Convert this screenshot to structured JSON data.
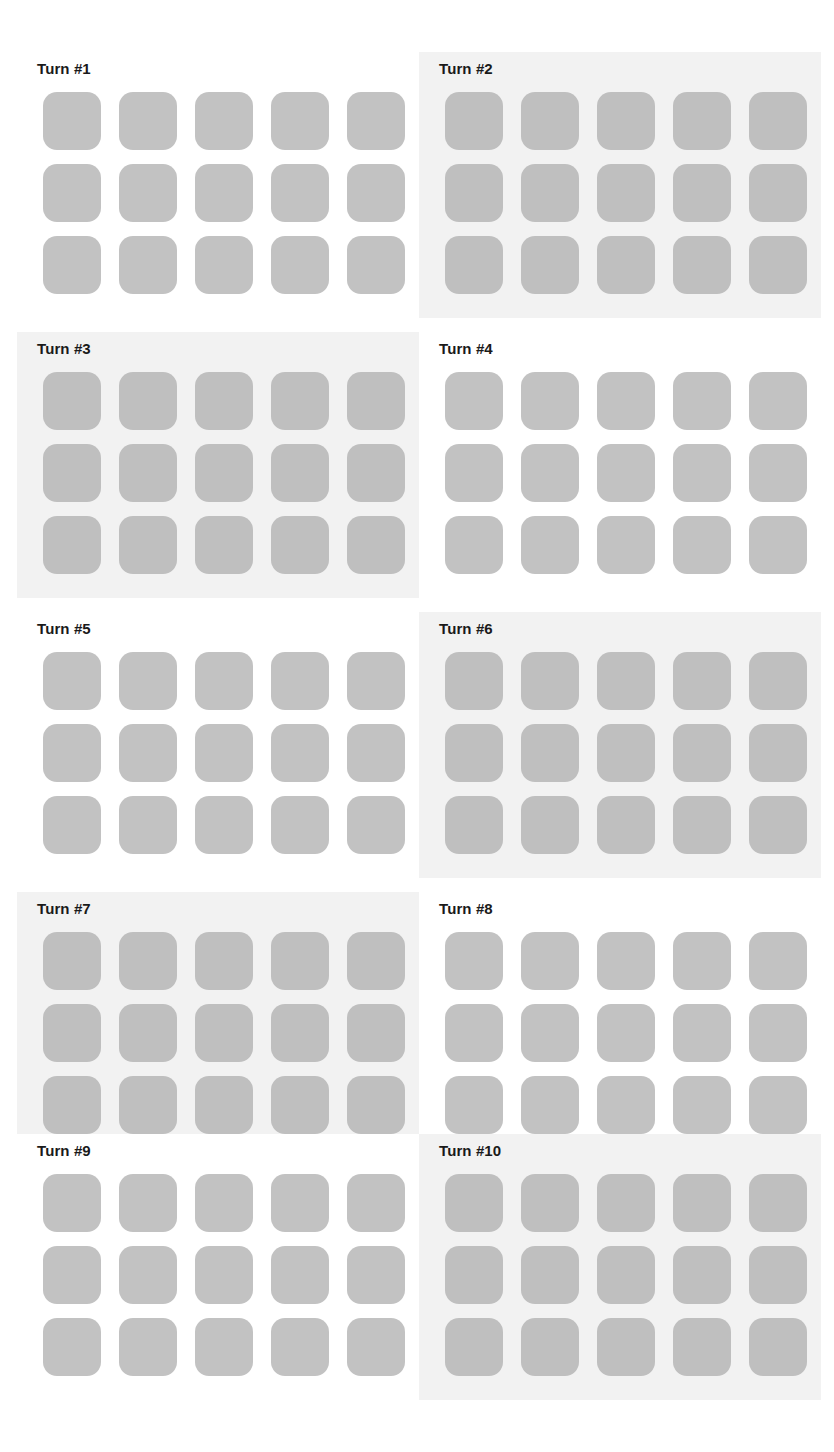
{
  "page": {
    "background_color": "#ffffff",
    "width": 834,
    "height": 1452,
    "columns": 2,
    "rows": 5
  },
  "style": {
    "tile_color": "#c2c2c2",
    "shaded_panel_color": "#f2f2f2",
    "plain_panel_color": "#ffffff",
    "title_color": "#1a1a1a"
  },
  "grid_spec": {
    "tile_columns": 5,
    "tile_rows": 3,
    "tiles_per_turn": 15
  },
  "turns": [
    {
      "id": 1,
      "label": "Turn #1",
      "shaded": false,
      "tiles": [
        [
          "#c2c2c2",
          "#c2c2c2",
          "#c2c2c2",
          "#c2c2c2",
          "#c2c2c2"
        ],
        [
          "#c2c2c2",
          "#c2c2c2",
          "#c2c2c2",
          "#c2c2c2",
          "#c2c2c2"
        ],
        [
          "#c2c2c2",
          "#c2c2c2",
          "#c2c2c2",
          "#c2c2c2",
          "#c2c2c2"
        ]
      ]
    },
    {
      "id": 2,
      "label": "Turn #2",
      "shaded": true,
      "tiles": [
        [
          "#bfbfbf",
          "#bfbfbf",
          "#bfbfbf",
          "#bfbfbf",
          "#bfbfbf"
        ],
        [
          "#bfbfbf",
          "#bfbfbf",
          "#bfbfbf",
          "#bfbfbf",
          "#bfbfbf"
        ],
        [
          "#bfbfbf",
          "#bfbfbf",
          "#bfbfbf",
          "#bfbfbf",
          "#bfbfbf"
        ]
      ]
    },
    {
      "id": 3,
      "label": "Turn #3",
      "shaded": true,
      "tiles": [
        [
          "#bfbfbf",
          "#bfbfbf",
          "#bfbfbf",
          "#bfbfbf",
          "#bfbfbf"
        ],
        [
          "#bfbfbf",
          "#bfbfbf",
          "#bfbfbf",
          "#bfbfbf",
          "#bfbfbf"
        ],
        [
          "#bfbfbf",
          "#bfbfbf",
          "#bfbfbf",
          "#bfbfbf",
          "#bfbfbf"
        ]
      ]
    },
    {
      "id": 4,
      "label": "Turn #4",
      "shaded": false,
      "tiles": [
        [
          "#c2c2c2",
          "#c2c2c2",
          "#c2c2c2",
          "#c2c2c2",
          "#c2c2c2"
        ],
        [
          "#c2c2c2",
          "#c2c2c2",
          "#c2c2c2",
          "#c2c2c2",
          "#c2c2c2"
        ],
        [
          "#c2c2c2",
          "#c2c2c2",
          "#c2c2c2",
          "#c2c2c2",
          "#c2c2c2"
        ]
      ]
    },
    {
      "id": 5,
      "label": "Turn #5",
      "shaded": false,
      "tiles": [
        [
          "#c2c2c2",
          "#c2c2c2",
          "#c2c2c2",
          "#c2c2c2",
          "#c2c2c2"
        ],
        [
          "#c2c2c2",
          "#c2c2c2",
          "#c2c2c2",
          "#c2c2c2",
          "#c2c2c2"
        ],
        [
          "#c2c2c2",
          "#c2c2c2",
          "#c2c2c2",
          "#c2c2c2",
          "#c2c2c2"
        ]
      ]
    },
    {
      "id": 6,
      "label": "Turn #6",
      "shaded": true,
      "tiles": [
        [
          "#bfbfbf",
          "#bfbfbf",
          "#bfbfbf",
          "#bfbfbf",
          "#bfbfbf"
        ],
        [
          "#bfbfbf",
          "#bfbfbf",
          "#bfbfbf",
          "#bfbfbf",
          "#bfbfbf"
        ],
        [
          "#bfbfbf",
          "#bfbfbf",
          "#bfbfbf",
          "#bfbfbf",
          "#bfbfbf"
        ]
      ]
    },
    {
      "id": 7,
      "label": "Turn #7",
      "shaded": true,
      "tiles": [
        [
          "#bfbfbf",
          "#bfbfbf",
          "#bfbfbf",
          "#bfbfbf",
          "#bfbfbf"
        ],
        [
          "#bfbfbf",
          "#bfbfbf",
          "#bfbfbf",
          "#bfbfbf",
          "#bfbfbf"
        ],
        [
          "#bfbfbf",
          "#bfbfbf",
          "#bfbfbf",
          "#bfbfbf",
          "#bfbfbf"
        ]
      ]
    },
    {
      "id": 8,
      "label": "Turn #8",
      "shaded": false,
      "tiles": [
        [
          "#c2c2c2",
          "#c2c2c2",
          "#c2c2c2",
          "#c2c2c2",
          "#c2c2c2"
        ],
        [
          "#c2c2c2",
          "#c2c2c2",
          "#c2c2c2",
          "#c2c2c2",
          "#c2c2c2"
        ],
        [
          "#c2c2c2",
          "#c2c2c2",
          "#c2c2c2",
          "#c2c2c2",
          "#c2c2c2"
        ]
      ]
    },
    {
      "id": 9,
      "label": "Turn #9",
      "shaded": false,
      "tiles": [
        [
          "#c2c2c2",
          "#c2c2c2",
          "#c2c2c2",
          "#c2c2c2",
          "#c2c2c2"
        ],
        [
          "#c2c2c2",
          "#c2c2c2",
          "#c2c2c2",
          "#c2c2c2",
          "#c2c2c2"
        ],
        [
          "#c2c2c2",
          "#c2c2c2",
          "#c2c2c2",
          "#c2c2c2",
          "#c2c2c2"
        ]
      ]
    },
    {
      "id": 10,
      "label": "Turn #10",
      "shaded": true,
      "tiles": [
        [
          "#bfbfbf",
          "#bfbfbf",
          "#bfbfbf",
          "#bfbfbf",
          "#bfbfbf"
        ],
        [
          "#bfbfbf",
          "#bfbfbf",
          "#bfbfbf",
          "#bfbfbf",
          "#bfbfbf"
        ],
        [
          "#bfbfbf",
          "#bfbfbf",
          "#bfbfbf",
          "#bfbfbf",
          "#bfbfbf"
        ]
      ]
    }
  ]
}
